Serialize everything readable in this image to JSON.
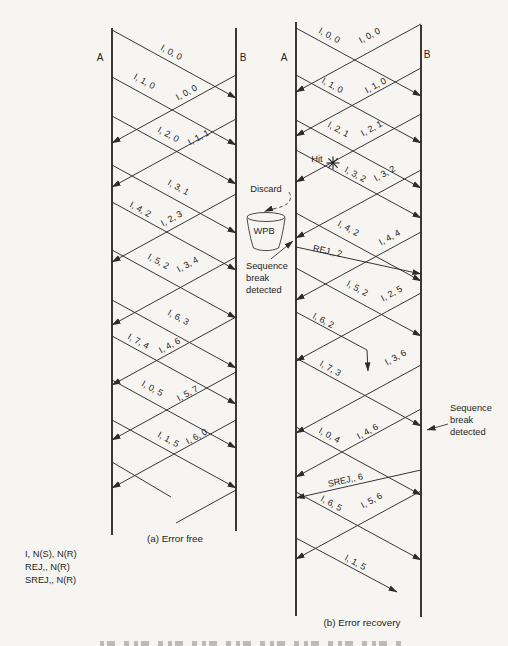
{
  "page": {
    "bg": "#f6f5f1",
    "ink": "#2b2b2b"
  },
  "legend": {
    "x": 25,
    "y": 557,
    "line_height": 13,
    "lines": [
      "I, N(S), N(R)",
      "REJ,, N(R)",
      "SREJ,, N(R)"
    ]
  },
  "diagrams": [
    {
      "id": "a",
      "caption": "(a)  Error free",
      "caption_x": 175,
      "caption_y": 542,
      "endpoint_a": {
        "label": "A",
        "x": 112,
        "top": 28,
        "bottom": 535,
        "letter_x": 100,
        "letter_y": 61
      },
      "endpoint_b": {
        "label": "B",
        "x": 236,
        "top": 28,
        "bottom": 531,
        "letter_x": 243,
        "letter_y": 61
      },
      "messages": [
        {
          "l": "I, 0, 0",
          "p": [
            [
              112,
              30
            ],
            [
              236,
              98
            ]
          ],
          "lx": 170,
          "ly": 55
        },
        {
          "l": "I, 1, 0",
          "p": [
            [
              112,
              77
            ],
            [
              236,
              145
            ]
          ],
          "lx": 143,
          "ly": 84
        },
        {
          "l": "I, 0, 0",
          "p": [
            [
              236,
              75
            ],
            [
              112,
              143
            ]
          ],
          "lx": 188,
          "ly": 95
        },
        {
          "l": "I, 2, 0",
          "p": [
            [
              112,
              116
            ],
            [
              236,
              184
            ]
          ],
          "lx": 167,
          "ly": 137
        },
        {
          "l": "I, 1, 1",
          "p": [
            [
              236,
              119
            ],
            [
              112,
              187
            ]
          ],
          "lx": 200,
          "ly": 140
        },
        {
          "l": "I, 3, 1",
          "p": [
            [
              112,
              165
            ],
            [
              236,
              233
            ]
          ],
          "lx": 177,
          "ly": 190
        },
        {
          "l": "I, 4, 2",
          "p": [
            [
              112,
              202
            ],
            [
              236,
              270
            ]
          ],
          "lx": 139,
          "ly": 212
        },
        {
          "l": "I, 2, 3",
          "p": [
            [
              236,
              194
            ],
            [
              112,
              262
            ]
          ],
          "lx": 173,
          "ly": 221
        },
        {
          "l": "I, 5, 2",
          "p": [
            [
              112,
              250
            ],
            [
              236,
              318
            ]
          ],
          "lx": 157,
          "ly": 264
        },
        {
          "l": "I, 3, 4",
          "p": [
            [
              236,
              257
            ],
            [
              112,
              325
            ]
          ],
          "lx": 189,
          "ly": 267
        },
        {
          "l": "I, 6, 3",
          "p": [
            [
              112,
              300
            ],
            [
              236,
              368
            ]
          ],
          "lx": 177,
          "ly": 320
        },
        {
          "l": "I, 7, 4",
          "p": [
            [
              112,
              336
            ],
            [
              236,
              404
            ]
          ],
          "lx": 137,
          "ly": 344
        },
        {
          "l": "I, 4, 6",
          "p": [
            [
              236,
              317
            ],
            [
              112,
              385
            ]
          ],
          "lx": 171,
          "ly": 348
        },
        {
          "l": "I, 0, 5",
          "p": [
            [
              112,
              380
            ],
            [
              236,
              448
            ]
          ],
          "lx": 151,
          "ly": 391
        },
        {
          "l": "I, 5, 7",
          "p": [
            [
              236,
              372
            ],
            [
              112,
              440
            ]
          ],
          "lx": 189,
          "ly": 396
        },
        {
          "l": "I, 1, 5",
          "p": [
            [
              112,
              420
            ],
            [
              236,
              488
            ]
          ],
          "lx": 167,
          "ly": 442
        },
        {
          "l": "I, 6, 0",
          "p": [
            [
              236,
              420
            ],
            [
              112,
              488
            ]
          ],
          "lx": 198,
          "ly": 439
        },
        {
          "l": "",
          "p": [
            [
              112,
              462
            ],
            [
              171,
              497
            ]
          ],
          "head": false
        },
        {
          "l": "",
          "p": [
            [
              236,
              490
            ],
            [
              176,
              523
            ]
          ],
          "head": false
        }
      ]
    },
    {
      "id": "b",
      "caption": "(b)  Error recovery",
      "caption_x": 362,
      "caption_y": 626,
      "endpoint_a": {
        "label": "A",
        "x": 296,
        "top": 22,
        "bottom": 616,
        "letter_x": 284,
        "letter_y": 61
      },
      "endpoint_b": {
        "label": "B",
        "x": 421,
        "top": 25,
        "bottom": 617,
        "letter_x": 427,
        "letter_y": 58
      },
      "messages": [
        {
          "l": "I, 0, 0",
          "p": [
            [
              296,
              28
            ],
            [
              421,
              96
            ]
          ],
          "lx": 328,
          "ly": 38
        },
        {
          "l": "I, 0, 0",
          "p": [
            [
              421,
              24
            ],
            [
              296,
              92
            ]
          ],
          "lx": 371,
          "ly": 38
        },
        {
          "l": "I, 1, 0",
          "p": [
            [
              296,
              75
            ],
            [
              421,
              143
            ]
          ],
          "lx": 331,
          "ly": 88
        },
        {
          "l": "I, 1, 0",
          "p": [
            [
              421,
              68
            ],
            [
              296,
              136
            ]
          ],
          "lx": 377,
          "ly": 88
        },
        {
          "l": "I, 2, 1",
          "p": [
            [
              296,
              120
            ],
            [
              421,
              188
            ]
          ],
          "lx": 337,
          "ly": 132
        },
        {
          "l": "I, 2, 1",
          "p": [
            [
              421,
              114
            ],
            [
              296,
              182
            ]
          ],
          "lx": 373,
          "ly": 131
        },
        {
          "l": "I, 3, 2",
          "p": [
            [
              296,
              150
            ],
            [
              421,
              218
            ]
          ],
          "lx": 354,
          "ly": 177
        },
        {
          "l": "I, 3, 2",
          "p": [
            [
              421,
              170
            ],
            [
              296,
              238
            ]
          ],
          "lx": 386,
          "ly": 176
        },
        {
          "l": "I, 4, 2",
          "p": [
            [
              296,
              213
            ],
            [
              421,
              281
            ]
          ],
          "lx": 347,
          "ly": 231
        },
        {
          "l": "REJ,, 2",
          "p": [
            [
              296,
              247
            ],
            [
              421,
              274
            ]
          ],
          "lx": 327,
          "ly": 254
        },
        {
          "l": "I, 4, 4",
          "p": [
            [
              421,
              232
            ],
            [
              296,
              300
            ]
          ],
          "lx": 391,
          "ly": 240
        },
        {
          "l": "I, 5, 2",
          "p": [
            [
              296,
              268
            ],
            [
              421,
              336
            ]
          ],
          "lx": 356,
          "ly": 291
        },
        {
          "l": "I, 2, 5",
          "p": [
            [
              421,
              293
            ],
            [
              296,
              361
            ]
          ],
          "lx": 393,
          "ly": 296
        },
        {
          "l": "I, 6, 2",
          "p": [
            [
              296,
              312
            ],
            [
              367,
              350
            ],
            [
              368,
              371
            ]
          ],
          "lx": 322,
          "ly": 323
        },
        {
          "l": "I, 3, 6",
          "p": [
            [
              421,
              365
            ],
            [
              296,
              433
            ]
          ],
          "lx": 397,
          "ly": 360
        },
        {
          "l": "I, 7, 3",
          "p": [
            [
              296,
              358
            ],
            [
              421,
              426
            ]
          ],
          "lx": 329,
          "ly": 371
        },
        {
          "l": "I, 0, 4",
          "p": [
            [
              296,
              427
            ],
            [
              421,
              495
            ]
          ],
          "lx": 328,
          "ly": 438
        },
        {
          "l": "I, 4, 6",
          "p": [
            [
              421,
              409
            ],
            [
              296,
              477
            ]
          ],
          "lx": 369,
          "ly": 434
        },
        {
          "l": "SREJ,, 6",
          "p": [
            [
              421,
              470
            ],
            [
              296,
              498
            ]
          ],
          "lx": 346,
          "ly": 483
        },
        {
          "l": "I, 6, 5",
          "p": [
            [
              296,
              492
            ],
            [
              421,
              560
            ]
          ],
          "lx": 330,
          "ly": 506
        },
        {
          "l": "I, 5, 6",
          "p": [
            [
              421,
              491
            ],
            [
              296,
              559
            ]
          ],
          "lx": 373,
          "ly": 503
        },
        {
          "l": "I, 1, 5",
          "p": [
            [
              296,
              538
            ],
            [
              397,
              592
            ]
          ],
          "lx": 354,
          "ly": 565
        }
      ],
      "annotations": {
        "hit": {
          "text": "Hit",
          "x": 317,
          "y": 162,
          "star_x": 333,
          "star_y": 163
        },
        "discard": {
          "text": "Discard",
          "x": 266,
          "y": 192,
          "arc": "M 289,192 C 294,201 286,206 277,208 C 271,209.5 267,210.5 264.5,211.5"
        },
        "wpb": {
          "text": "WPB",
          "x": 264,
          "y": 234,
          "ellipse": {
            "cx": 266,
            "cy": 217,
            "rx": 19,
            "ry": 4.5
          },
          "body": "M 247,218 C 248.5,229 251,241 253.5,248 C 261,251.5 271,251.5 278.5,248 C 281,241 283.5,229 285,218"
        },
        "seq_break_left": {
          "lines": [
            "Sequence",
            "break",
            "detected"
          ],
          "x": 246,
          "y": 269,
          "line_height": 12,
          "pointer": [
            [
              271,
              259
            ],
            [
              293,
              241
            ]
          ]
        },
        "seq_break_right": {
          "lines": [
            "Sequence",
            "break",
            "detected"
          ],
          "x": 450,
          "y": 411,
          "line_height": 12,
          "pointer": [
            [
              448,
              424
            ],
            [
              427,
              430
            ]
          ]
        }
      }
    }
  ]
}
